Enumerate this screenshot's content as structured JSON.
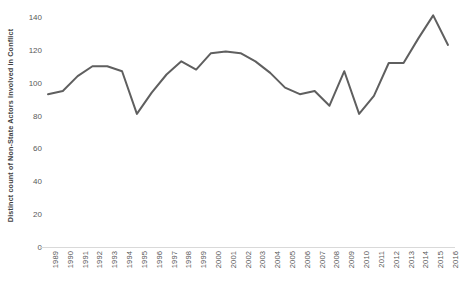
{
  "chart_data": {
    "type": "line",
    "title": "",
    "subtitle": "",
    "xlabel": "",
    "ylabel": "Distinct count of Non-State Actors Involved in Conflict",
    "categories": [
      "1989",
      "1990",
      "1991",
      "1992",
      "1993",
      "1994",
      "1995",
      "1996",
      "1997",
      "1998",
      "1999",
      "2000",
      "2001",
      "2002",
      "2003",
      "2004",
      "2005",
      "2006",
      "2007",
      "2008",
      "2009",
      "2010",
      "2011",
      "2012",
      "2013",
      "2014",
      "2015",
      "2016"
    ],
    "values": [
      93,
      95,
      104,
      110,
      110,
      107,
      81,
      94,
      105,
      113,
      108,
      118,
      119,
      118,
      113,
      106,
      97,
      93,
      95,
      86,
      107,
      81,
      92,
      112,
      112,
      127,
      141,
      123
    ],
    "series": [
      {
        "name": "Distinct count of Non-State Actors Involved in Conflict",
        "values": [
          93,
          95,
          104,
          110,
          110,
          107,
          81,
          94,
          105,
          113,
          108,
          118,
          119,
          118,
          113,
          106,
          97,
          93,
          95,
          86,
          107,
          81,
          92,
          112,
          112,
          127,
          141,
          123
        ],
        "color": "#5f5f5f"
      }
    ],
    "y_ticks": [
      0,
      20,
      40,
      60,
      80,
      100,
      120,
      140
    ],
    "x_tick_labels": [
      "1989",
      "1990",
      "1991",
      "1992",
      "1993",
      "1994",
      "1995",
      "1996",
      "1997",
      "1998",
      "1999",
      "2000",
      "2001",
      "2002",
      "2003",
      "2004",
      "2005",
      "2006",
      "2007",
      "2008",
      "2009",
      "2010",
      "2011",
      "2012",
      "2013",
      "2014",
      "2015",
      "2016"
    ],
    "ylim": [
      0,
      145
    ],
    "xlim": [
      "1989",
      "2016"
    ],
    "grid": false,
    "legend": false,
    "legend_position": "none",
    "line_color": "#5f5f5f",
    "line_width": 2,
    "markers": false,
    "annotations": []
  },
  "axes": {
    "y_title": "Distinct count of Non-State Actors Involved in Conflict",
    "axis_line_color": "#d9d9d9",
    "tick_text_color": "#595959"
  },
  "colors": {
    "background": "#ffffff",
    "series_line": "#5f5f5f",
    "axis": "#d9d9d9",
    "text": "#3f3f3f"
  }
}
